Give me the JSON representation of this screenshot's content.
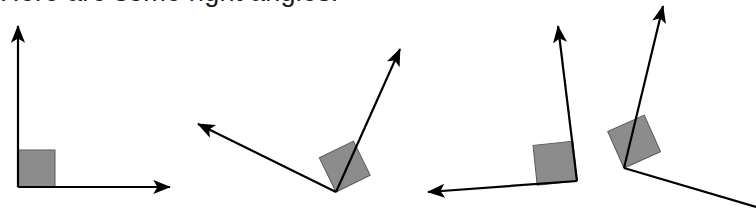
{
  "page": {
    "title": "Here are some right angles.",
    "width": 756,
    "height": 216,
    "background_color": "#ffffff"
  },
  "heading": {
    "text": "Here are some right angles.",
    "color": "#1a1a1a",
    "clipped_at_top": true
  },
  "style": {
    "ray_color": "#000000",
    "ray_width": 2.2,
    "square_fill": "#8c8c8c",
    "square_stroke": "#5a5a5a",
    "arrowhead_color": "#000000"
  },
  "diagram": {
    "type": "right-angle-illustrations",
    "count": 4,
    "angles": [
      {
        "name": "right-angle-1",
        "label": "upright axes right angle",
        "vertex": [
          18,
          187
        ],
        "ray_a": {
          "tip": [
            18,
            24
          ],
          "direction_deg": 90,
          "arrow": true
        },
        "ray_b": {
          "tip": [
            172,
            187
          ],
          "direction_deg": 0,
          "arrow": true
        },
        "square": {
          "size": 37,
          "rotation_deg": 0,
          "corner": [
            18,
            187
          ]
        },
        "measure_deg": 90
      },
      {
        "name": "right-angle-2",
        "label": "tilted V right angle",
        "vertex": [
          336,
          192
        ],
        "ray_a": {
          "tip": [
            194,
            122
          ],
          "direction_deg": 154,
          "arrow": true
        },
        "ray_b": {
          "tip": [
            403,
            45
          ],
          "direction_deg": 64,
          "arrow": true
        },
        "square": {
          "size": 38,
          "rotation_deg": -26,
          "corner": [
            336,
            192
          ]
        },
        "measure_deg": 90
      },
      {
        "name": "right-angle-3",
        "label": "leftward horizontal and upright right angle",
        "vertex": [
          577,
          181
        ],
        "ray_a": {
          "tip": [
            424,
            193
          ],
          "direction_deg": 184,
          "arrow": true
        },
        "ray_b": {
          "tip": [
            557,
            22
          ],
          "direction_deg": 94,
          "arrow": true
        },
        "square": {
          "size": 40,
          "rotation_deg": -6,
          "corner": [
            577,
            181
          ]
        },
        "measure_deg": 90
      },
      {
        "name": "right-angle-4",
        "label": "rightward descending and upright right angle",
        "vertex": [
          624,
          168
        ],
        "ray_a": {
          "tip": [
            664,
            2
          ],
          "direction_deg": 76,
          "arrow": true
        },
        "ray_b": {
          "tip": [
            756,
            207
          ],
          "direction_deg": -24,
          "arrow": true
        },
        "square": {
          "size": 40,
          "rotation_deg": -24,
          "corner": [
            624,
            168
          ]
        },
        "measure_deg": 90
      }
    ]
  }
}
